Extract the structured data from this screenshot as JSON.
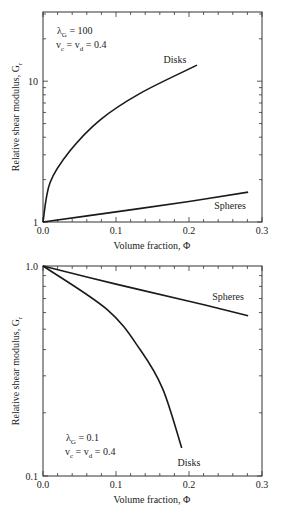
{
  "chart_data": [
    {
      "type": "line",
      "title": "",
      "xlabel": "Volume fraction, Φ",
      "ylabel": "Relative shear modulus, G_r",
      "ylabel_main": "Relative shear modulus, G",
      "ylabel_sub": "r",
      "xscale": "linear",
      "yscale": "log",
      "xlim": [
        0.0,
        0.3
      ],
      "ylim": [
        1,
        31
      ],
      "x_ticks": [
        "0.0",
        "0.1",
        "0.2",
        "0.3"
      ],
      "y_ticks": [
        "1",
        "10"
      ],
      "grid": false,
      "annotation": {
        "line1_main": "λ",
        "line1_sub": "G",
        "line1_rest": " = 100",
        "line2": "v",
        "line2_sub_c": "c",
        "line2_mid": " = v",
        "line2_sub_d": "d",
        "line2_rest": " = 0.4"
      },
      "series": [
        {
          "name": "Disks",
          "x": [
            0.0,
            0.0096,
            0.037,
            0.078,
            0.133,
            0.211
          ],
          "y": [
            1.0,
            1.9,
            3.2,
            5.3,
            8.2,
            13.0
          ]
        },
        {
          "name": "Spheres",
          "x": [
            0.0,
            0.1,
            0.2,
            0.281
          ],
          "y": [
            1.0,
            1.18,
            1.4,
            1.63
          ]
        }
      ]
    },
    {
      "type": "line",
      "title": "",
      "xlabel": "Volume fraction, Φ",
      "ylabel": "Relative shear modulus, G_r",
      "ylabel_main": "Relative shear modulus, G",
      "ylabel_sub": "r",
      "xscale": "linear",
      "yscale": "log",
      "xlim": [
        0.0,
        0.3
      ],
      "ylim": [
        0.1,
        1.0
      ],
      "x_ticks": [
        "0.0",
        "0.1",
        "0.2",
        "0.3"
      ],
      "y_ticks": [
        "1.0",
        "0.1"
      ],
      "grid": false,
      "annotation": {
        "line1_main": "λ",
        "line1_sub": "G",
        "line1_rest": " = 0.1",
        "line2": "v",
        "line2_sub_c": "c",
        "line2_mid": " = v",
        "line2_sub_d": "d",
        "line2_rest": " = 0.4"
      },
      "series": [
        {
          "name": "Disks",
          "x": [
            0.0,
            0.088,
            0.133,
            0.164,
            0.19
          ],
          "y": [
            1.0,
            0.62,
            0.4,
            0.26,
            0.136
          ]
        },
        {
          "name": "Spheres",
          "x": [
            0.0,
            0.1,
            0.2,
            0.281
          ],
          "y": [
            1.0,
            0.82,
            0.68,
            0.58
          ]
        }
      ]
    }
  ]
}
